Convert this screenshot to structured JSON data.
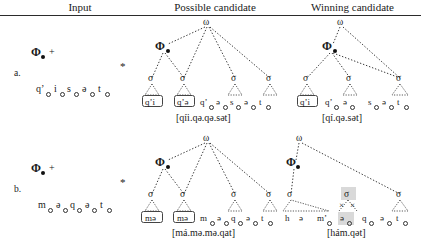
{
  "figure": {
    "headers": {
      "input": "Input",
      "possible": "Possible candidate",
      "winning": "Winning candidate"
    },
    "symbols": {
      "omega": "ω",
      "phi": "Φ",
      "sigma": "σ",
      "plus": "+",
      "star": "*",
      "xmark": "×"
    },
    "rows": [
      {
        "label": "a.",
        "input": {
          "prefix": "Φ",
          "plus": "+",
          "star": "*",
          "segments": [
            "qʼ",
            "i",
            "s",
            "ə",
            "t"
          ]
        },
        "possible": {
          "root": "ω",
          "phi": "Φ",
          "syllables": [
            "σ",
            "σ",
            "σ",
            "σ"
          ],
          "boxed": [
            "qʼi",
            "qʼə"
          ],
          "segments": [
            "qʼ",
            "ə",
            "s",
            "ə",
            "t"
          ],
          "output": "[qíi.qə.qə.sət]"
        },
        "winning": {
          "root": "ω",
          "phi": "Φ",
          "syllables": [
            "σ",
            "σ",
            "σ"
          ],
          "boxed": [
            "qʼi"
          ],
          "segments": [
            "qʼ",
            "ə",
            "s",
            "ə",
            "t"
          ],
          "output": "[qí.qə.sət]"
        }
      },
      {
        "label": "b.",
        "input": {
          "prefix": "Φ",
          "plus": "+",
          "star": "*",
          "segments": [
            "m",
            "ə",
            "q",
            "ə",
            "t"
          ]
        },
        "possible": {
          "root": "ω",
          "phi": "Φ",
          "syllables": [
            "σ",
            "σ",
            "σ",
            "σ"
          ],
          "boxed": [
            "mə",
            "mə"
          ],
          "segments": [
            "m",
            "ə",
            "q",
            "ə",
            "t"
          ],
          "output": "[má.mə.mə.qat]"
        },
        "winning": {
          "root": "ω",
          "phi": "Φ",
          "syllables": [
            "σ",
            "σ",
            "σ"
          ],
          "delinked_syllable": "σ",
          "segments": [
            "h",
            "ə",
            "mʼ",
            "ə",
            "q",
            "ə",
            "t"
          ],
          "output": "[hám.qət]"
        }
      }
    ]
  }
}
